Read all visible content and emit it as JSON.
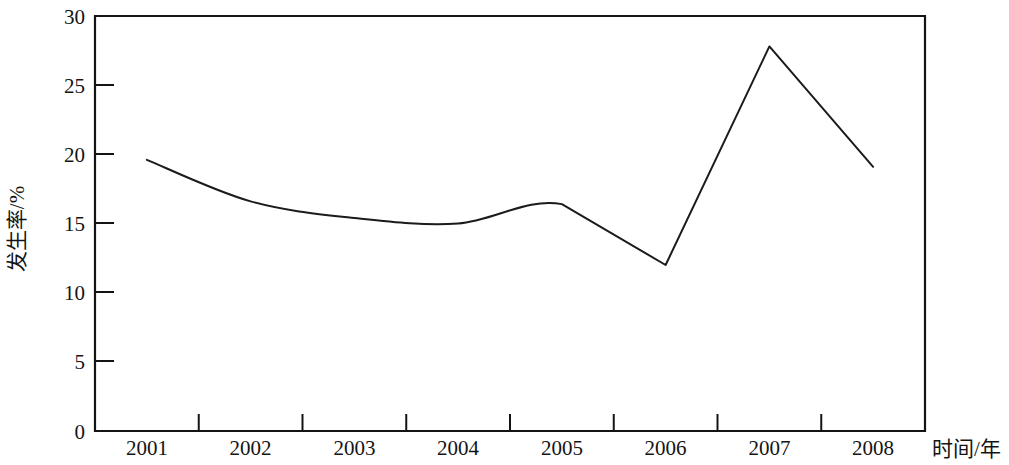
{
  "chart_data": {
    "type": "line",
    "title": "",
    "subtitle": "",
    "xlabel": "时间/年",
    "ylabel": "发生率/%",
    "categories": [
      "2001",
      "2002",
      "2003",
      "2004",
      "2005",
      "2006",
      "2007",
      "2008"
    ],
    "values": [
      19.6,
      16.6,
      15.4,
      15.0,
      16.4,
      12.0,
      27.8,
      19.1
    ],
    "series": [
      {
        "name": "发生率",
        "values": [
          19.6,
          16.6,
          15.4,
          15.0,
          16.4,
          12.0,
          27.8,
          19.1
        ]
      }
    ],
    "ylim": [
      0,
      30
    ],
    "y_ticks": [
      "0",
      "5",
      "10",
      "15",
      "20",
      "25",
      "30"
    ],
    "y_tick_values": [
      0,
      5,
      10,
      15,
      20,
      25,
      30
    ],
    "x_ticks": [
      "2001",
      "2002",
      "2003",
      "2004",
      "2005",
      "2006",
      "2007",
      "2008"
    ],
    "grid": false,
    "legend": false,
    "legend_position": "none",
    "line_color": "#1b1b1b",
    "axis_color": "#141414",
    "background_color": "#ffffff",
    "markers": false,
    "smoothing": "curve-then-linear",
    "annotations": []
  },
  "axes": {
    "y_title": "发生率/%",
    "x_title": "时间/年",
    "y_labels": [
      "30",
      "25",
      "20",
      "15",
      "10",
      "5",
      "0"
    ],
    "x_labels": [
      "2001",
      "2002",
      "2003",
      "2004",
      "2005",
      "2006",
      "2007",
      "2008"
    ]
  }
}
